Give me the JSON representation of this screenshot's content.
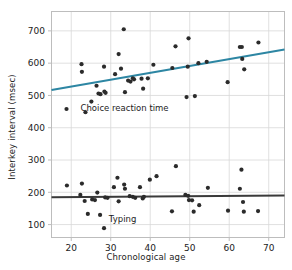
{
  "chart_data": {
    "type": "scatter",
    "title": "",
    "xlabel": "Chronological age",
    "ylabel": "Interkey interval (msec)",
    "xlim": [
      15,
      74
    ],
    "ylim": [
      60,
      760
    ],
    "xticks": [
      20,
      30,
      40,
      50,
      60,
      70
    ],
    "yticks": [
      100,
      200,
      300,
      400,
      500,
      600,
      700
    ],
    "grid": true,
    "legend_position": "inline-annotation",
    "colors": {
      "choice_line": "#2d86a3",
      "typing_line": "#3a3a3a",
      "point": "#2b2b2b",
      "grid": "#d8d8d8",
      "frame": "#bdbdbd",
      "text": "#1c1c1c"
    },
    "annotations": [
      {
        "text": "Choice reaction time",
        "x": 33.5,
        "y": 452
      },
      {
        "text": "Typing",
        "x": 33.0,
        "y": 108
      }
    ],
    "series": [
      {
        "name": "Choice reaction time",
        "marker": "circle",
        "color": "#2b2b2b",
        "trendline": {
          "color": "#2d86a3",
          "x": [
            15,
            74
          ],
          "y": [
            517,
            642
          ]
        },
        "points": [
          [
            18.8,
            458
          ],
          [
            22.6,
            597
          ],
          [
            22.7,
            573
          ],
          [
            23.6,
            448
          ],
          [
            25.1,
            481
          ],
          [
            26.4,
            530
          ],
          [
            26.9,
            506
          ],
          [
            27.4,
            504
          ],
          [
            28.3,
            589
          ],
          [
            28.4,
            512
          ],
          [
            28.7,
            508
          ],
          [
            31.1,
            566
          ],
          [
            32.0,
            628
          ],
          [
            32.6,
            583
          ],
          [
            33.3,
            705
          ],
          [
            33.6,
            510
          ],
          [
            34.4,
            546
          ],
          [
            35.0,
            543
          ],
          [
            35.6,
            553
          ],
          [
            35.9,
            550
          ],
          [
            37.8,
            552
          ],
          [
            38.2,
            521
          ],
          [
            39.4,
            553
          ],
          [
            40.8,
            595
          ],
          [
            45.6,
            585
          ],
          [
            46.4,
            652
          ],
          [
            49.2,
            495
          ],
          [
            49.5,
            589
          ],
          [
            49.7,
            677
          ],
          [
            51.3,
            498
          ],
          [
            52.2,
            600
          ],
          [
            54.3,
            604
          ],
          [
            59.6,
            541
          ],
          [
            62.7,
            650
          ],
          [
            63.2,
            650
          ],
          [
            63.3,
            613
          ],
          [
            63.8,
            581
          ],
          [
            67.4,
            664
          ]
        ]
      },
      {
        "name": "Typing",
        "marker": "circle",
        "color": "#2b2b2b",
        "trendline": {
          "color": "#3a3a3a",
          "x": [
            15,
            74
          ],
          "y": [
            185,
            190
          ]
        },
        "points": [
          [
            18.9,
            221
          ],
          [
            22.3,
            192
          ],
          [
            22.7,
            227
          ],
          [
            23.4,
            173
          ],
          [
            24.2,
            133
          ],
          [
            25.3,
            178
          ],
          [
            26.0,
            176
          ],
          [
            26.6,
            199
          ],
          [
            27.3,
            130
          ],
          [
            28.3,
            89
          ],
          [
            28.6,
            184
          ],
          [
            29.2,
            183
          ],
          [
            30.8,
            216
          ],
          [
            31.7,
            245
          ],
          [
            32.0,
            172
          ],
          [
            33.4,
            224
          ],
          [
            33.6,
            211
          ],
          [
            34.8,
            188
          ],
          [
            35.6,
            186
          ],
          [
            36.2,
            183
          ],
          [
            37.4,
            216
          ],
          [
            38.1,
            181
          ],
          [
            38.4,
            186
          ],
          [
            39.9,
            239
          ],
          [
            41.6,
            250
          ],
          [
            45.5,
            141
          ],
          [
            46.5,
            281
          ],
          [
            48.9,
            192
          ],
          [
            49.6,
            189
          ],
          [
            49.8,
            176
          ],
          [
            50.6,
            175
          ],
          [
            51.0,
            140
          ],
          [
            52.4,
            160
          ],
          [
            54.6,
            214
          ],
          [
            59.7,
            143
          ],
          [
            62.7,
            211
          ],
          [
            63.1,
            270
          ],
          [
            63.5,
            170
          ],
          [
            63.7,
            140
          ],
          [
            67.3,
            142
          ]
        ]
      }
    ]
  }
}
